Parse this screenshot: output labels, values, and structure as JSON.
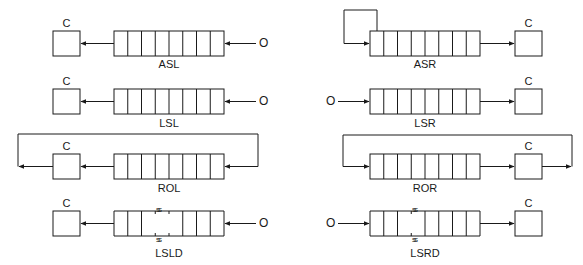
{
  "diagram": {
    "title": "",
    "colors": {
      "line": "#1a1a1a",
      "background": "#ffffff"
    },
    "register_bits": 8,
    "carry_label": "C",
    "zero_input_label": "O",
    "break_mark": "ss",
    "operations": [
      {
        "id": "asl",
        "label": "ASL",
        "side": "left",
        "row": 1,
        "carry_position": "left",
        "input": "O (zero) shifted in from right",
        "output": "MSB shifted into C"
      },
      {
        "id": "lsl",
        "label": "LSL",
        "side": "left",
        "row": 2,
        "carry_position": "left",
        "input": "O (zero) shifted in from right",
        "output": "MSB shifted into C"
      },
      {
        "id": "rol",
        "label": "ROL",
        "side": "left",
        "row": 3,
        "carry_position": "left",
        "input": "C fed back into LSB via loop",
        "output": "MSB shifted into C"
      },
      {
        "id": "lsld",
        "label": "LSLD",
        "side": "left",
        "row": 4,
        "carry_position": "left",
        "input": "O (zero) shifted in from right",
        "output": "MSB shifted into C",
        "double_register": true
      },
      {
        "id": "asr",
        "label": "ASR",
        "side": "right",
        "row": 1,
        "carry_position": "right",
        "input": "MSB fed back into itself (sign preserved)",
        "output": "LSB shifted into C"
      },
      {
        "id": "lsr",
        "label": "LSR",
        "side": "right",
        "row": 2,
        "carry_position": "right",
        "input": "O (zero) shifted in from left",
        "output": "LSB shifted into C"
      },
      {
        "id": "ror",
        "label": "ROR",
        "side": "right",
        "row": 3,
        "carry_position": "right",
        "input": "C fed back into MSB via loop",
        "output": "LSB shifted into C"
      },
      {
        "id": "lsrd",
        "label": "LSRD",
        "side": "right",
        "row": 4,
        "carry_position": "right",
        "input": "O (zero) shifted in from left",
        "output": "LSB shifted into C",
        "double_register": true
      }
    ]
  }
}
